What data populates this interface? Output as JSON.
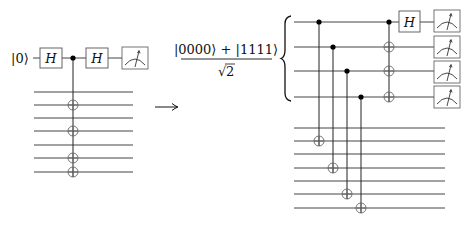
{
  "left_circuit": {
    "input_label": "|0⟩",
    "gate1_label": "H",
    "gate2_label": "H",
    "top_wire_y": 58,
    "wire_x_start": 34,
    "wire_x_end": 133,
    "ancilla_wire_ys": [
      92,
      105,
      118,
      131,
      145,
      158,
      172
    ],
    "control_x": 73,
    "target_wire_indices": [
      1,
      3,
      5,
      6
    ],
    "measurement": "meter-icon"
  },
  "transition": {
    "arrow": "→"
  },
  "state": {
    "numerator": "|0000⟩ + |1111⟩",
    "denominator_root": "√",
    "denominator_value": "2"
  },
  "right_circuit": {
    "h_gate_label": "H",
    "top_wire_ys": [
      22,
      47,
      71,
      97
    ],
    "ancilla_wire_ys": [
      128,
      141,
      154,
      168,
      181,
      194,
      208
    ],
    "wire_x_start": 294,
    "top_wire_x_end": 434,
    "ancilla_wire_x_end": 445,
    "fanout_controls": [
      {
        "x": 319,
        "control_wire": 0,
        "target_ancilla": 1
      },
      {
        "x": 333,
        "control_wire": 1,
        "target_ancilla": 3
      },
      {
        "x": 347,
        "control_wire": 2,
        "target_ancilla": 5
      },
      {
        "x": 361,
        "control_wire": 3,
        "target_ancilla": 6
      }
    ],
    "cnot_x": 389,
    "cnot_control_wire": 0,
    "cnot_target_wires": [
      1,
      2,
      3
    ],
    "measurements": [
      "meter-icon",
      "meter-icon",
      "meter-icon",
      "meter-icon"
    ]
  }
}
